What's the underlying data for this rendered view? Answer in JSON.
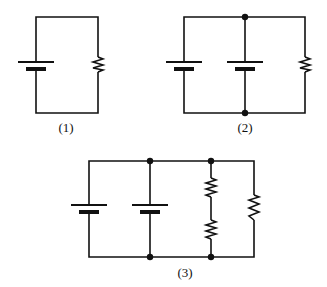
{
  "figure": {
    "colors": {
      "ink": "#111111",
      "background": "#ffffff"
    },
    "circuits": [
      {
        "id": 1,
        "label": "(1)",
        "components": {
          "batteries": 1,
          "resistors": 1,
          "junctions": 0
        },
        "description": "Single battery connected to single resistor"
      },
      {
        "id": 2,
        "label": "(2)",
        "components": {
          "batteries": 2,
          "resistors": 1,
          "junctions": 2
        },
        "description": "Two batteries in parallel connected to one resistor"
      },
      {
        "id": 3,
        "label": "(3)",
        "components": {
          "batteries": 2,
          "resistors": 3,
          "junctions": 4
        },
        "description": "Two batteries in parallel; two series resistors in parallel with a third resistor"
      }
    ]
  }
}
